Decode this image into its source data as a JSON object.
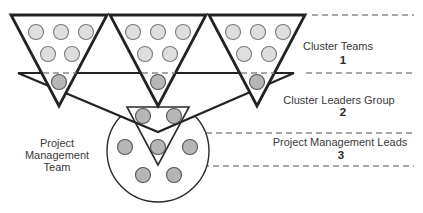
{
  "diagram": {
    "tiers": [
      {
        "label": "Cluster Teams",
        "number": "1"
      },
      {
        "label": "Cluster Leaders Group",
        "number": "2"
      },
      {
        "label": "Project Management Leads",
        "number": "3"
      }
    ],
    "pm_team_label": [
      "Project",
      "Management",
      "Team"
    ],
    "cluster_team_count": 3,
    "members_per_cluster_team": 5,
    "cluster_leaders_count": 3,
    "pm_team_members_count": 7,
    "colors": {
      "outline": "#222222",
      "member_light": "#dedede",
      "member_dark": "#b6b6b6",
      "dashed_rule": "#8a8a8a",
      "text": "#3a3a3a"
    }
  }
}
